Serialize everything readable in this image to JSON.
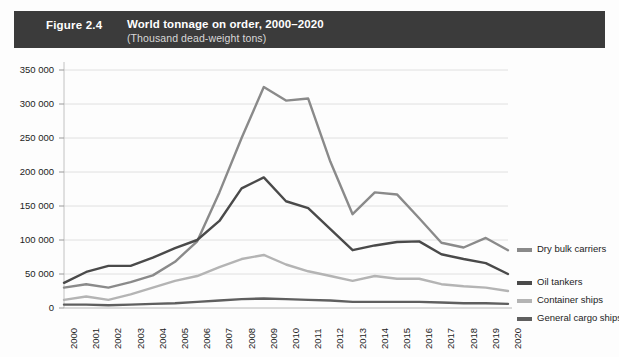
{
  "header": {
    "figure_number": "Figure 2.4",
    "title": "World tonnage on order, 2000–2020",
    "subtitle": "(Thousand dead-weight tons)",
    "bar_color": "#3b3b3b",
    "text_color": "#ffffff"
  },
  "chart_data": {
    "type": "line",
    "title": "World tonnage on order, 2000–2020",
    "subtitle": "(Thousand dead-weight tons)",
    "xlabel": "",
    "ylabel": "",
    "ylim": [
      0,
      350000
    ],
    "ytick_step": 50000,
    "grid": true,
    "legend_position": "right",
    "categories": [
      "2000",
      "2001",
      "2002",
      "2003",
      "2004",
      "2005",
      "2006",
      "2007",
      "2008",
      "2009",
      "2010",
      "2011",
      "2012",
      "2013",
      "2014",
      "2015",
      "2016",
      "2017",
      "2018",
      "2019",
      "2020"
    ],
    "ytick_labels": [
      "0",
      "50 000",
      "100 000",
      "150 000",
      "200 000",
      "250 000",
      "300 000",
      "350 000"
    ],
    "yticks": [
      0,
      50000,
      100000,
      150000,
      200000,
      250000,
      300000,
      350000
    ],
    "series": [
      {
        "name": "Dry bulk carriers",
        "color": "#8a8a8a",
        "values": [
          30000,
          35000,
          30000,
          38000,
          48000,
          68000,
          98000,
          170000,
          250000,
          325000,
          305000,
          308000,
          215000,
          138000,
          170000,
          167000,
          132000,
          96000,
          89000,
          103000,
          85000
        ]
      },
      {
        "name": "Oil tankers",
        "color": "#4a4a4a",
        "values": [
          37000,
          53000,
          62000,
          62000,
          74000,
          88000,
          100000,
          128000,
          176000,
          192000,
          157000,
          147000,
          116000,
          85000,
          92000,
          97000,
          98000,
          79000,
          72000,
          66000,
          50000
        ]
      },
      {
        "name": "Container ships",
        "color": "#b4b4b4",
        "values": [
          12000,
          17000,
          12000,
          20000,
          30000,
          40000,
          47000,
          60000,
          72000,
          78000,
          64000,
          54000,
          47000,
          40000,
          47000,
          43000,
          43000,
          35000,
          32000,
          30000,
          25000
        ]
      },
      {
        "name": "General cargo ships",
        "color": "#5f5f5f",
        "values": [
          5000,
          5000,
          4000,
          5000,
          6000,
          7000,
          9000,
          11000,
          13000,
          14000,
          13000,
          12000,
          11000,
          9000,
          9000,
          9000,
          9000,
          8000,
          7000,
          7000,
          6000
        ]
      }
    ]
  },
  "legend": {
    "items": [
      {
        "label": "Dry bulk carriers",
        "color": "#8a8a8a"
      },
      {
        "label": "Oil tankers",
        "color": "#4a4a4a"
      },
      {
        "label": "Container ships",
        "color": "#b4b4b4"
      },
      {
        "label": "General cargo ships",
        "color": "#5f5f5f"
      }
    ]
  }
}
